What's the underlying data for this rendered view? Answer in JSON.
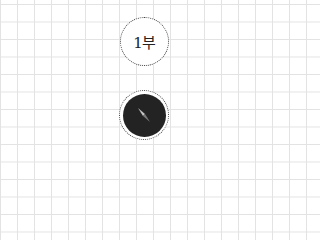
{
  "map_controls": {
    "zoom_level_label": "1부",
    "compass": {
      "icon": "compass-needle-icon",
      "disc_color": "#232323",
      "needle_light": "#bdbdbd",
      "needle_dark": "#7a7a7a"
    }
  },
  "background": {
    "type": "grid-paper",
    "grid_color": "#e3e3e3"
  }
}
